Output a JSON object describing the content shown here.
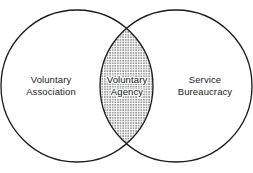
{
  "diagram": {
    "type": "venn",
    "title": "",
    "background_color": "#ffffff",
    "stroke_color": "#1a1a1a",
    "stroke_width": 1.3,
    "text_color": "#1c1c1c",
    "fill_pattern": "dotted-halftone",
    "fill_dot_color": "#2b2b2b",
    "sets": [
      {
        "id": "left",
        "label_line1": "Voluntary",
        "label_line2": "Association",
        "center_x": 77,
        "center_y": 86,
        "radius": 76,
        "filled": false
      },
      {
        "id": "right",
        "label_line1": "Service",
        "label_line2": "Bureaucracy",
        "center_x": 176,
        "center_y": 86,
        "radius": 76,
        "filled": false
      }
    ],
    "intersection": {
      "id": "center",
      "label_line1": "Voluntary",
      "label_line2": "Agency",
      "filled": true,
      "fill_pattern": "dotted-halftone"
    }
  }
}
